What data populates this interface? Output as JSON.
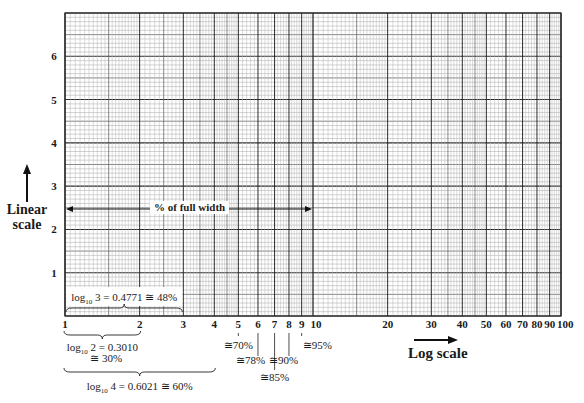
{
  "chart_data": {
    "type": "log-linear graph paper",
    "title": "",
    "x_axis": {
      "scale": "log",
      "label": "Log scale",
      "range": [
        1,
        100
      ],
      "decades": 2,
      "tick_labels": [
        "1",
        "2",
        "3",
        "4",
        "5",
        "6",
        "7",
        "8",
        "9",
        "10",
        "20",
        "30",
        "40",
        "50",
        "60",
        "70",
        "80",
        "90",
        "100"
      ],
      "tick_values": [
        1,
        2,
        3,
        4,
        5,
        6,
        7,
        8,
        9,
        10,
        20,
        30,
        40,
        50,
        60,
        70,
        80,
        90,
        100
      ]
    },
    "y_axis": {
      "scale": "linear",
      "label": "Linear scale",
      "range": [
        0,
        7
      ],
      "tick_labels": [
        "1",
        "2",
        "3",
        "4",
        "5",
        "6"
      ],
      "tick_values": [
        1,
        2,
        3,
        4,
        5,
        6
      ],
      "minor_divisions_per_unit": 10
    },
    "grid": true,
    "annotations": {
      "full_width": "% of full width",
      "log3": {
        "base": "log",
        "sub": "10",
        "rest": " 3 = 0.4771 ≅ 48%",
        "span": [
          1,
          3
        ]
      },
      "log2": {
        "line1_base": "log",
        "sub": "10",
        "line1_rest": " 2 = 0.3010",
        "line2": "≅ 30%",
        "span": [
          1,
          2
        ]
      },
      "log4": {
        "base": "log",
        "sub": "10",
        "rest": " 4 = 0.6021 ≅ 60%",
        "span": [
          1,
          4
        ]
      },
      "percent_marks": [
        {
          "value": 5,
          "label": "≅70%"
        },
        {
          "value": 6,
          "label": "≅78%"
        },
        {
          "value": 7,
          "label": "≅85%"
        },
        {
          "value": 8,
          "label": "≅90%"
        },
        {
          "value": 9,
          "label": "≅95%"
        }
      ]
    }
  },
  "labels": {
    "linear_line1": "Linear",
    "linear_line2": "scale",
    "log_scale": "Log scale",
    "full_width": "% of full width"
  },
  "colors": {
    "major": "#2b2b2b",
    "mid": "#6a6a6a",
    "minor": "#b4b4b4",
    "text": "#1a1a1a"
  }
}
